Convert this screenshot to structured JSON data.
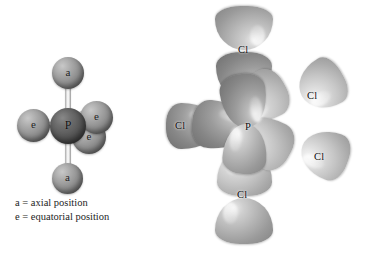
{
  "figure": {
    "background_color": "#ffffff",
    "width": 380,
    "height": 253
  },
  "ball_stick_model": {
    "name": "PCl5 trigonal bipyramidal ball-and-stick model",
    "central_atom": {
      "label": "P",
      "color": "#575757"
    },
    "ligand_color": "#8e8e8e",
    "atoms": [
      {
        "label": "a",
        "position_name": "axial-top"
      },
      {
        "label": "a",
        "position_name": "axial-bottom"
      },
      {
        "label": "e",
        "position_name": "equatorial-left"
      },
      {
        "label": "e",
        "position_name": "equatorial-upper-right"
      },
      {
        "label": "e",
        "position_name": "equatorial-lower-right"
      }
    ],
    "legend": {
      "line1": "a = axial position",
      "line2": "e = equatorial position"
    }
  },
  "orbital_model": {
    "name": "PCl5 orbital overlap model",
    "central_atom_label": "P",
    "ligand_labels": [
      {
        "label": "Cl",
        "position_name": "axial-top"
      },
      {
        "label": "Cl",
        "position_name": "equatorial-upper-right"
      },
      {
        "label": "Cl",
        "position_name": "equatorial-lower-right"
      },
      {
        "label": "Cl",
        "position_name": "equatorial-left"
      },
      {
        "label": "Cl",
        "position_name": "axial-bottom"
      }
    ],
    "lobe_colors": {
      "dark": "#868686",
      "mid": "#b3b3b3",
      "light": "#c6c6c6"
    }
  }
}
